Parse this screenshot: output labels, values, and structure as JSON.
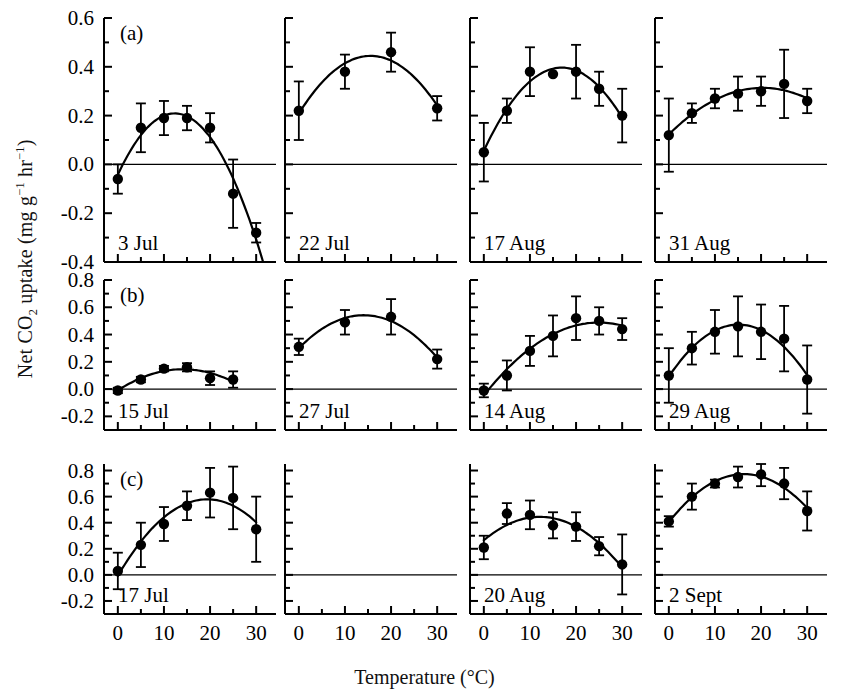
{
  "figure": {
    "xlabel_main": "Temperature",
    "xlabel_unit": "(°C)",
    "ylabel_pre": "Net CO",
    "ylabel_sub": "2",
    "ylabel_mid": " uptake (mg g",
    "ylabel_sup1": "−1",
    "ylabel_mid2": " hr",
    "ylabel_sup2": "−1",
    "ylabel_end": ")",
    "row_labels": [
      "(a)",
      "(b)",
      "(c)"
    ],
    "marker_color": "#000000",
    "line_color": "#000000",
    "axis_color": "#000000",
    "background": "#ffffff"
  },
  "chart_data": {
    "type": "scatter",
    "title": "",
    "xlabel": "Temperature (°C)",
    "ylabel": "Net CO2 uptake (mg g-1 hr-1)",
    "xlim": [
      -3,
      33
    ],
    "xticks": [
      0,
      5,
      10,
      15,
      20,
      25,
      30
    ],
    "xticklabels": [
      "0",
      "",
      "10",
      "",
      "20",
      "",
      "30"
    ],
    "grid": false,
    "legend": "none",
    "rows": [
      {
        "row_label": "(a)",
        "ylim": [
          -0.4,
          0.6
        ],
        "yticks": [
          -0.4,
          -0.2,
          0.0,
          0.2,
          0.4,
          0.6
        ],
        "yticklabels": [
          "-0.4",
          "-0.2",
          "0.0",
          "0.2",
          "0.4",
          "0.6"
        ],
        "minor_yticks": [
          -0.3,
          -0.1,
          0.1,
          0.3,
          0.5
        ],
        "panels": [
          {
            "label": "3 Jul",
            "x": [
              0,
              5,
              10,
              15,
              20,
              25,
              30
            ],
            "y": [
              -0.06,
              0.15,
              0.19,
              0.19,
              0.15,
              -0.12,
              -0.28
            ],
            "err": [
              0.06,
              0.1,
              0.07,
              0.05,
              0.06,
              0.14,
              0.04
            ],
            "fit": "quadratic"
          },
          {
            "label": "22 Jul",
            "x": [
              0,
              10,
              20,
              30
            ],
            "y": [
              0.22,
              0.38,
              0.46,
              0.23
            ],
            "err": [
              0.12,
              0.07,
              0.08,
              0.05
            ],
            "fit": "quadratic"
          },
          {
            "label": "17 Aug",
            "x": [
              0,
              5,
              10,
              15,
              20,
              25,
              30
            ],
            "y": [
              0.05,
              0.22,
              0.38,
              0.37,
              0.38,
              0.31,
              0.2
            ],
            "err": [
              0.12,
              0.05,
              0.1,
              0.0,
              0.11,
              0.07,
              0.11
            ],
            "fit": "quadratic"
          },
          {
            "label": "31 Aug",
            "x": [
              0,
              5,
              10,
              15,
              20,
              25,
              30
            ],
            "y": [
              0.12,
              0.21,
              0.27,
              0.29,
              0.3,
              0.33,
              0.26
            ],
            "err": [
              0.15,
              0.04,
              0.04,
              0.07,
              0.06,
              0.14,
              0.05
            ],
            "fit": "quadratic"
          }
        ]
      },
      {
        "row_label": "(b)",
        "ylim": [
          -0.3,
          0.8
        ],
        "yticks": [
          -0.2,
          0.0,
          0.2,
          0.4,
          0.6,
          0.8
        ],
        "yticklabels": [
          "-0.2",
          "0.0",
          "0.2",
          "0.4",
          "0.6",
          "0.8"
        ],
        "minor_yticks": [
          -0.1,
          0.1,
          0.3,
          0.5,
          0.7
        ],
        "panels": [
          {
            "label": "15 Jul",
            "x": [
              0,
              5,
              10,
              15,
              20,
              25
            ],
            "y": [
              -0.01,
              0.07,
              0.15,
              0.16,
              0.08,
              0.07
            ],
            "err": [
              0.02,
              0.02,
              0.02,
              0.03,
              0.05,
              0.06
            ],
            "fit": "quadratic"
          },
          {
            "label": "27 Jul",
            "x": [
              0,
              10,
              20,
              30
            ],
            "y": [
              0.31,
              0.49,
              0.53,
              0.22
            ],
            "err": [
              0.06,
              0.09,
              0.13,
              0.07
            ],
            "fit": "quadratic"
          },
          {
            "label": "14 Aug",
            "x": [
              0,
              5,
              10,
              15,
              20,
              25,
              30
            ],
            "y": [
              -0.01,
              0.1,
              0.28,
              0.39,
              0.52,
              0.5,
              0.44
            ],
            "err": [
              0.05,
              0.11,
              0.11,
              0.15,
              0.16,
              0.1,
              0.08
            ],
            "fit": "quadratic"
          },
          {
            "label": "29 Aug",
            "x": [
              0,
              5,
              10,
              15,
              20,
              25,
              30
            ],
            "y": [
              0.1,
              0.3,
              0.42,
              0.46,
              0.42,
              0.37,
              0.07
            ],
            "err": [
              0.2,
              0.12,
              0.16,
              0.22,
              0.2,
              0.24,
              0.25
            ],
            "fit": "quadratic"
          }
        ]
      },
      {
        "row_label": "(c)",
        "ylim": [
          -0.3,
          0.85
        ],
        "yticks": [
          -0.2,
          0.0,
          0.2,
          0.4,
          0.6,
          0.8
        ],
        "yticklabels": [
          "-0.2",
          "0.0",
          "0.2",
          "0.4",
          "0.6",
          "0.8"
        ],
        "minor_yticks": [
          -0.1,
          0.1,
          0.3,
          0.5,
          0.7
        ],
        "panels": [
          {
            "label": "17 Jul",
            "x": [
              0,
              5,
              10,
              15,
              20,
              25,
              30
            ],
            "y": [
              0.03,
              0.23,
              0.39,
              0.53,
              0.63,
              0.59,
              0.35
            ],
            "err": [
              0.14,
              0.17,
              0.13,
              0.11,
              0.19,
              0.24,
              0.25
            ],
            "fit": "quadratic"
          },
          {
            "label": "",
            "x": [],
            "y": [],
            "err": [],
            "fit": "none"
          },
          {
            "label": "20 Aug",
            "x": [
              0,
              5,
              10,
              15,
              20,
              25,
              30
            ],
            "y": [
              0.21,
              0.47,
              0.46,
              0.38,
              0.37,
              0.22,
              0.08
            ],
            "err": [
              0.09,
              0.08,
              0.11,
              0.1,
              0.11,
              0.07,
              0.23
            ],
            "fit": "quadratic"
          },
          {
            "label": "2 Sept",
            "x": [
              0,
              5,
              10,
              15,
              20,
              25,
              30
            ],
            "y": [
              0.41,
              0.6,
              0.7,
              0.75,
              0.77,
              0.7,
              0.49
            ],
            "err": [
              0.04,
              0.1,
              0.03,
              0.08,
              0.09,
              0.12,
              0.15
            ],
            "fit": "quadratic"
          }
        ]
      }
    ]
  }
}
